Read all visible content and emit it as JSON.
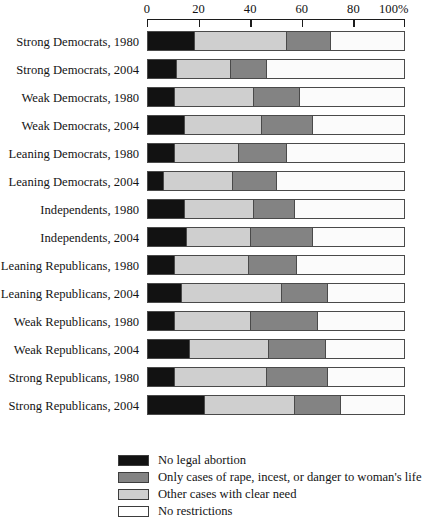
{
  "chart_data": {
    "type": "bar",
    "orientation": "horizontal",
    "stacked": true,
    "normalized_percent": true,
    "title": "",
    "subtitle": "",
    "xlabel": "",
    "ylabel": "",
    "xlim": [
      0,
      100
    ],
    "grid": false,
    "legend_position": "bottom-left",
    "axis_ticks": [
      {
        "value": 0,
        "label": "0"
      },
      {
        "value": 20,
        "label": "20"
      },
      {
        "value": 40,
        "label": "40"
      },
      {
        "value": 60,
        "label": "60"
      },
      {
        "value": 80,
        "label": "80"
      },
      {
        "value": 100,
        "label": "100%"
      }
    ],
    "categories": [
      "Strong Democrats, 1980",
      "Strong Democrats, 2004",
      "Weak Democrats, 1980",
      "Weak Democrats, 2004",
      "Leaning Democrats, 1980",
      "Leaning Democrats, 2004",
      "Independents, 1980",
      "Independents, 2004",
      "Leaning Republicans, 1980",
      "Leaning Republicans, 2004",
      "Weak Republicans, 1980",
      "Weak Republicans, 2004",
      "Strong Republicans, 1980",
      "Strong Republicans, 2004"
    ],
    "series": [
      {
        "name": "No legal abortion",
        "color": "#121212",
        "values": [
          18,
          11,
          10,
          14,
          10,
          6,
          14,
          15,
          10,
          13,
          10,
          16,
          10,
          22
        ]
      },
      {
        "name": "Other cases with clear need",
        "color": "#cfcfcf",
        "values": [
          36,
          21,
          31,
          30,
          25,
          27,
          27,
          25,
          29,
          39,
          30,
          31,
          36,
          35
        ]
      },
      {
        "name": "Only cases of rape, incest, or danger to woman's life",
        "color": "#838383",
        "values": [
          17,
          14,
          18,
          20,
          19,
          17,
          16,
          24,
          19,
          18,
          26,
          22,
          24,
          18
        ]
      },
      {
        "name": "No restrictions",
        "color": "#ffffff",
        "values": [
          29,
          54,
          41,
          36,
          46,
          50,
          43,
          36,
          42,
          30,
          34,
          31,
          30,
          25
        ]
      }
    ],
    "rows": [
      {
        "label": "Strong Democrats, 1980",
        "segments": [
          18,
          36,
          17,
          29
        ]
      },
      {
        "label": "Strong Democrats, 2004",
        "segments": [
          11,
          21,
          14,
          54
        ]
      },
      {
        "label": "Weak Democrats, 1980",
        "segments": [
          10,
          31,
          18,
          41
        ]
      },
      {
        "label": "Weak Democrats, 2004",
        "segments": [
          14,
          30,
          20,
          36
        ]
      },
      {
        "label": "Leaning Democrats, 1980",
        "segments": [
          10,
          25,
          19,
          46
        ]
      },
      {
        "label": "Leaning Democrats, 2004",
        "segments": [
          6,
          27,
          17,
          50
        ]
      },
      {
        "label": "Independents, 1980",
        "segments": [
          14,
          27,
          16,
          43
        ]
      },
      {
        "label": "Independents, 2004",
        "segments": [
          15,
          25,
          24,
          36
        ]
      },
      {
        "label": "Leaning Republicans, 1980",
        "segments": [
          10,
          29,
          19,
          42
        ]
      },
      {
        "label": "Leaning Republicans, 2004",
        "segments": [
          13,
          39,
          18,
          30
        ]
      },
      {
        "label": "Weak Republicans, 1980",
        "segments": [
          10,
          30,
          26,
          34
        ]
      },
      {
        "label": "Weak Republicans, 2004",
        "segments": [
          16,
          31,
          22,
          31
        ]
      },
      {
        "label": "Strong Republicans, 1980",
        "segments": [
          10,
          36,
          24,
          30
        ]
      },
      {
        "label": "Strong Republicans, 2004",
        "segments": [
          22,
          35,
          18,
          25
        ]
      }
    ],
    "legend": [
      {
        "label": "No legal abortion",
        "color": "#121212"
      },
      {
        "label": "Only cases of rape, incest, or danger to woman's life",
        "color": "#838383"
      },
      {
        "label": "Other cases with clear need",
        "color": "#cfcfcf"
      },
      {
        "label": "No restrictions",
        "color": "#ffffff"
      }
    ]
  }
}
